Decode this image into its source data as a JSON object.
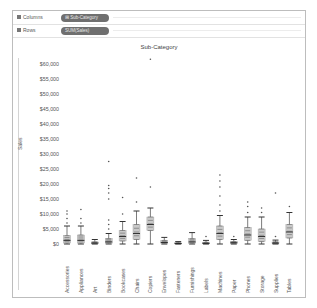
{
  "shelves": {
    "columns": {
      "label": "Columns",
      "pill": "⊞ Sub-Category"
    },
    "rows": {
      "label": "Rows",
      "pill": "SUM(Sales)"
    }
  },
  "chart_data": {
    "type": "boxplot",
    "title": "Sub-Category",
    "xlabel": "",
    "ylabel": "Sales",
    "ylim": [
      0,
      62000
    ],
    "yticks": [
      "$0",
      "$5,000",
      "$10,000",
      "$15,000",
      "$20,000",
      "$25,000",
      "$30,000",
      "$35,000",
      "$40,000",
      "$45,000",
      "$50,000",
      "$55,000",
      "$60,000"
    ],
    "grid": false,
    "categories": [
      "Accessories",
      "Appliances",
      "Art",
      "Binders",
      "Bookcases",
      "Chairs",
      "Copiers",
      "Envelopes",
      "Fasteners",
      "Furnishings",
      "Labels",
      "Machines",
      "Paper",
      "Phones",
      "Storage",
      "Supplies",
      "Tables"
    ],
    "boxes": [
      {
        "name": "Accessories",
        "min": 0,
        "q1": 300,
        "median": 1200,
        "q3": 2800,
        "max": 6000,
        "outliers": [
          7000,
          8500,
          10000,
          11000
        ]
      },
      {
        "name": "Appliances",
        "min": 0,
        "q1": 300,
        "median": 1200,
        "q3": 3000,
        "max": 6000,
        "outliers": [
          7000,
          8500,
          11500
        ]
      },
      {
        "name": "Art",
        "min": 0,
        "q1": 100,
        "median": 300,
        "q3": 700,
        "max": 1500,
        "outliers": []
      },
      {
        "name": "Binders",
        "min": 0,
        "q1": 200,
        "median": 700,
        "q3": 1800,
        "max": 3500,
        "outliers": [
          5000,
          6500,
          8000,
          15000,
          17000,
          18500,
          19500,
          27500
        ]
      },
      {
        "name": "Bookcases",
        "min": 0,
        "q1": 1000,
        "median": 2500,
        "q3": 4500,
        "max": 7500,
        "outliers": [
          10000,
          15500
        ]
      },
      {
        "name": "Chairs",
        "min": 0,
        "q1": 1500,
        "median": 3500,
        "q3": 6500,
        "max": 11000,
        "outliers": [
          14000,
          22000
        ]
      },
      {
        "name": "Copiers",
        "min": 0,
        "q1": 4500,
        "median": 6500,
        "q3": 9000,
        "max": 12000,
        "outliers": [
          19000,
          61600
        ]
      },
      {
        "name": "Envelopes",
        "min": 0,
        "q1": 150,
        "median": 500,
        "q3": 1200,
        "max": 2200,
        "outliers": []
      },
      {
        "name": "Fasteners",
        "min": 0,
        "q1": 50,
        "median": 150,
        "q3": 400,
        "max": 800,
        "outliers": []
      },
      {
        "name": "Furnishings",
        "min": 0,
        "q1": 200,
        "median": 700,
        "q3": 1800,
        "max": 3800,
        "outliers": []
      },
      {
        "name": "Labels",
        "min": 0,
        "q1": 50,
        "median": 200,
        "q3": 600,
        "max": 1200,
        "outliers": [
          2500
        ]
      },
      {
        "name": "Machines",
        "min": 0,
        "q1": 1500,
        "median": 3500,
        "q3": 6000,
        "max": 9500,
        "outliers": [
          11000,
          13000,
          16000,
          19000,
          21000,
          23000
        ]
      },
      {
        "name": "Paper",
        "min": 0,
        "q1": 100,
        "median": 400,
        "q3": 800,
        "max": 1500,
        "outliers": [
          2500
        ]
      },
      {
        "name": "Phones",
        "min": 0,
        "q1": 1200,
        "median": 3000,
        "q3": 5500,
        "max": 9000,
        "outliers": [
          10500,
          12500,
          14000
        ]
      },
      {
        "name": "Storage",
        "min": 0,
        "q1": 800,
        "median": 2500,
        "q3": 5000,
        "max": 9000,
        "outliers": [
          10500,
          12000
        ]
      },
      {
        "name": "Supplies",
        "min": 0,
        "q1": 100,
        "median": 300,
        "q3": 700,
        "max": 1300,
        "outliers": [
          2500,
          17000
        ]
      },
      {
        "name": "Tables",
        "min": 0,
        "q1": 2000,
        "median": 4000,
        "q3": 6500,
        "max": 10500,
        "outliers": [
          12500
        ]
      }
    ]
  }
}
